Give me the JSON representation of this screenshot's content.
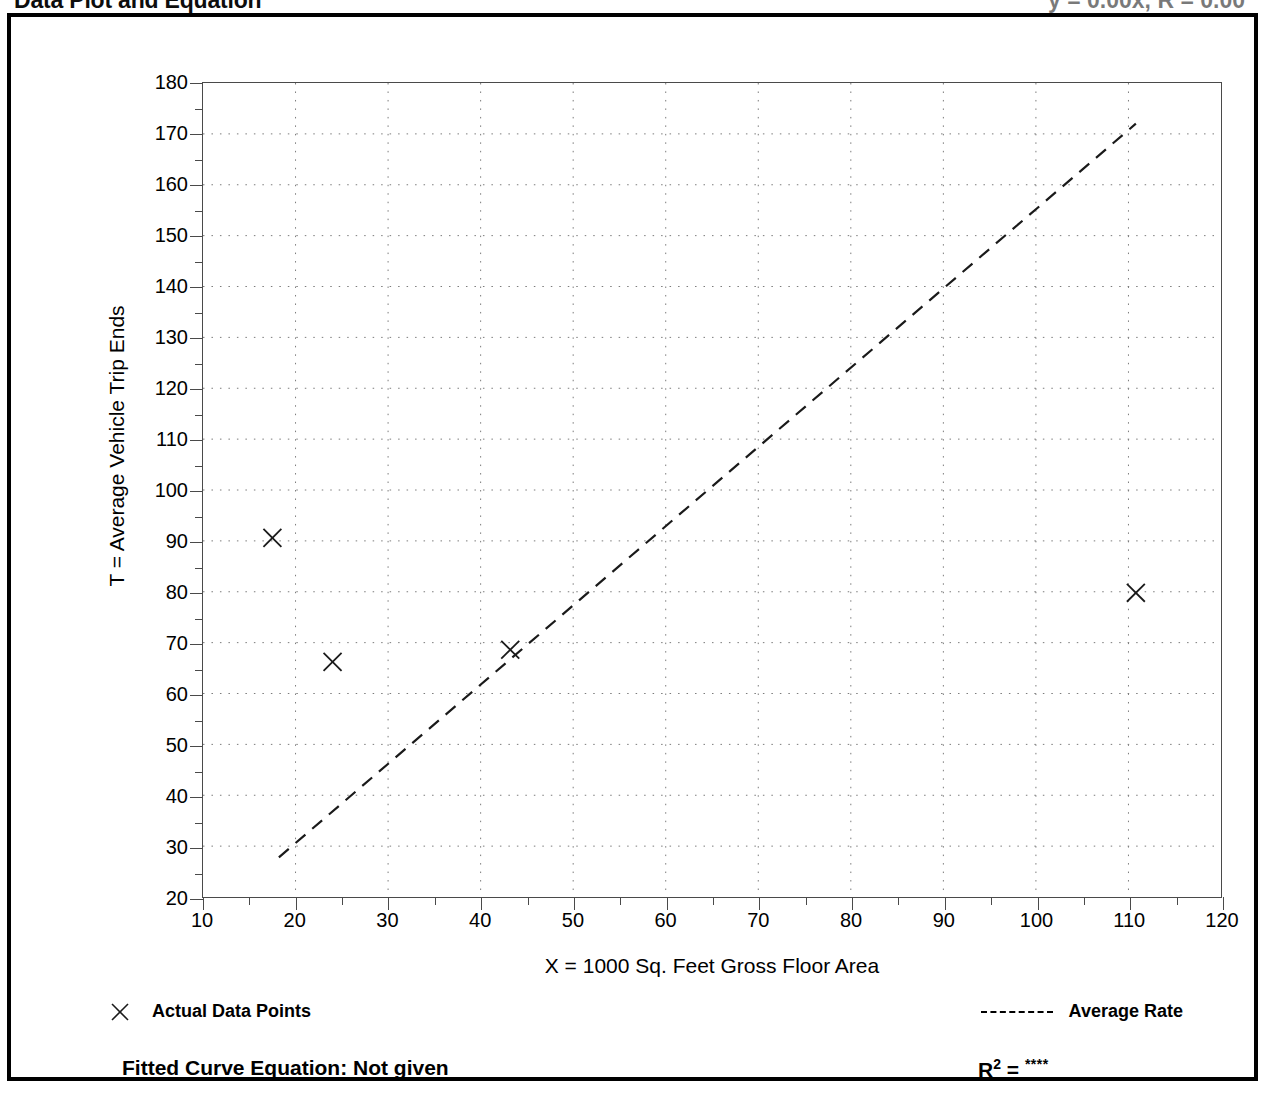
{
  "header": {
    "title": "Data Plot and Equation",
    "title_right": "y = 0.00x, R = 0.00"
  },
  "chart_data": {
    "type": "scatter",
    "title": "Data Plot and Equation",
    "xlabel": "X = 1000 Sq. Feet Gross Floor Area",
    "ylabel": "T = Average Vehicle Trip Ends",
    "xlim": [
      10,
      120
    ],
    "ylim": [
      20,
      180
    ],
    "x_major_step": 10,
    "x_minor_step": 5,
    "y_major_step": 10,
    "y_minor_step": 5,
    "grid": true,
    "grid_style": "dotted",
    "xticks": [
      10,
      20,
      30,
      40,
      50,
      60,
      70,
      80,
      90,
      100,
      110,
      120
    ],
    "yticks": [
      20,
      30,
      40,
      50,
      60,
      70,
      80,
      90,
      100,
      110,
      120,
      130,
      140,
      150,
      160,
      170,
      180
    ],
    "series": [
      {
        "name": "Actual Data Points",
        "type": "scatter",
        "marker": "x",
        "points": [
          {
            "x": 17.5,
            "y": 90.6
          },
          {
            "x": 24.0,
            "y": 66.2
          },
          {
            "x": 43.2,
            "y": 68.6
          },
          {
            "x": 110.8,
            "y": 79.8
          }
        ]
      },
      {
        "name": "Average Rate",
        "type": "line",
        "style": "dashed",
        "points": [
          {
            "x": 18.2,
            "y": 27.8
          },
          {
            "x": 110.8,
            "y": 172.0
          }
        ]
      }
    ],
    "legend_position": "below-axes",
    "annotations": {
      "fitted_curve_equation": "Fitted Curve Equation:  Not given",
      "r_squared_label": "R",
      "r_squared_exponent": "2",
      "r_squared_equals": "=",
      "r_squared_value": "****"
    }
  },
  "legend": {
    "points_label": "Actual Data Points",
    "rate_label": "Average Rate"
  },
  "colors": {
    "axis": "#4a4a4a",
    "grid": "#7a7a7a",
    "marker": "#1a1a1a",
    "line": "#1a1a1a",
    "border": "#000000"
  }
}
